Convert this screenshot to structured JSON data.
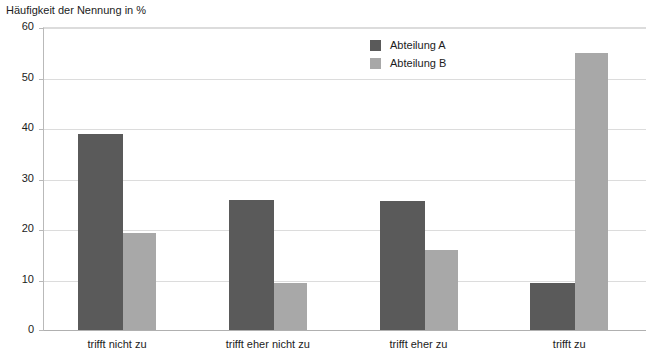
{
  "chart_data": {
    "type": "bar",
    "title": "Häufigkeit der Nennung in %",
    "xlabel": "",
    "ylabel": "Häufigkeit der Nennung in %",
    "ylim": [
      0,
      60
    ],
    "yticks": [
      0,
      10,
      20,
      30,
      40,
      50,
      60
    ],
    "grid": true,
    "legend_position": "top-center",
    "categories": [
      "trifft nicht zu",
      "trifft eher nicht zu",
      "trifft eher zu",
      "trifft zu"
    ],
    "series": [
      {
        "name": "Abteilung A",
        "color": "#5a5a5a",
        "values": [
          38.8,
          25.7,
          25.5,
          9.4
        ]
      },
      {
        "name": "Abteilung B",
        "color": "#a8a8a8",
        "values": [
          19.3,
          9.4,
          15.9,
          54.8
        ]
      }
    ]
  },
  "axes": {
    "y_tick_labels": [
      "60",
      "50",
      "40",
      "30",
      "20",
      "10",
      "0"
    ]
  },
  "legend": {
    "items": [
      {
        "label": "Abteilung A",
        "swatch": "#5a5a5a"
      },
      {
        "label": "Abteilung B",
        "swatch": "#a8a8a8"
      }
    ]
  }
}
